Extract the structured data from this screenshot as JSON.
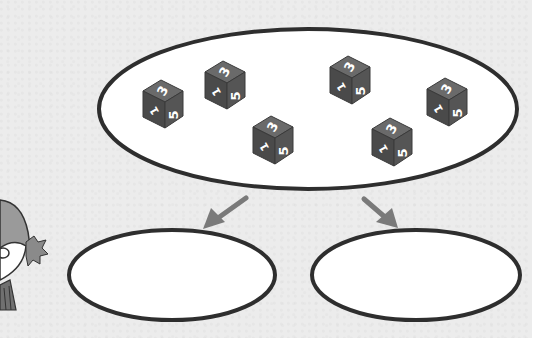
{
  "colors": {
    "panel_bg": "#ececec",
    "ellipse_fill": "#ffffff",
    "ellipse_stroke": "#2e2e2e",
    "die_top": "#6a6a6a",
    "die_left": "#4a4a4a",
    "die_right": "#555555",
    "arrow": "#7a7a7a"
  },
  "source_group": {
    "label": "group of dice",
    "dice_count": 7,
    "dice": [
      {
        "x": 160,
        "y": 105,
        "faces": {
          "top": "3",
          "left": "1",
          "right": "5"
        }
      },
      {
        "x": 222,
        "y": 87,
        "faces": {
          "top": "3",
          "left": "1",
          "right": "5"
        }
      },
      {
        "x": 271,
        "y": 142,
        "faces": {
          "top": "3",
          "left": "1",
          "right": "5"
        }
      },
      {
        "x": 350,
        "y": 80,
        "faces": {
          "top": "3",
          "left": "1",
          "right": "5"
        }
      },
      {
        "x": 390,
        "y": 145,
        "faces": {
          "top": "3",
          "left": "1",
          "right": "5"
        }
      },
      {
        "x": 446,
        "y": 102,
        "faces": {
          "top": "3",
          "left": "1",
          "right": "5"
        }
      }
    ]
  },
  "extra_die": {
    "x": 271,
    "y": 142
  },
  "targets": [
    {
      "label": "empty group left",
      "cx": 172,
      "cy": 275,
      "rx": 103,
      "ry": 45
    },
    {
      "label": "empty group right",
      "cx": 416,
      "cy": 275,
      "rx": 104,
      "ry": 45
    }
  ],
  "arrows": [
    {
      "direction": "down-left",
      "from": [
        247,
        197
      ],
      "to": [
        205,
        228
      ]
    },
    {
      "direction": "down-right",
      "from": [
        363,
        198
      ],
      "to": [
        397,
        228
      ]
    }
  ],
  "character": {
    "description": "partial cartoon child at left edge"
  }
}
